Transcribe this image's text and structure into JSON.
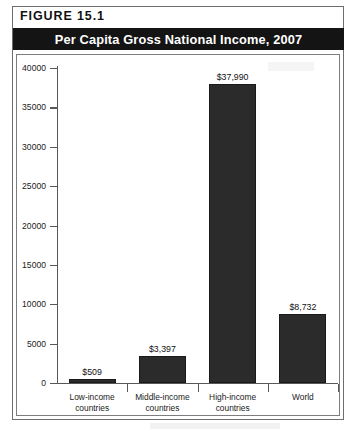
{
  "figure": {
    "label": "FIGURE  15.1",
    "title": "Per Capita Gross National Income, 2007"
  },
  "chart_data": {
    "type": "bar",
    "title": "Per Capita Gross National Income, 2007",
    "xlabel": "",
    "ylabel": "",
    "ylim": [
      0,
      40000
    ],
    "grid": false,
    "legend": null,
    "categories": [
      "Low-income countries",
      "Middle-income countries",
      "High-income countries",
      "World"
    ],
    "category_lines": [
      [
        "Low-income",
        "countries"
      ],
      [
        "Middle-income",
        "countries"
      ],
      [
        "High-income",
        "countries"
      ],
      [
        "World",
        ""
      ]
    ],
    "values": [
      509,
      3397,
      37990,
      8732
    ],
    "value_labels": [
      "$509",
      "$3,397",
      "$37,990",
      "$8,732"
    ],
    "ytick_values": [
      0,
      5000,
      10000,
      15000,
      20000,
      25000,
      30000,
      35000,
      40000
    ],
    "ytick_labels": [
      "0",
      "5000",
      "10000",
      "15000",
      "20000",
      "25000",
      "30000",
      "35000",
      "40000"
    ],
    "bar_color": "#2b2b2b",
    "axis_color": "#58585a",
    "title_band_color": "#141414",
    "title_text_color": "#ffffff"
  }
}
